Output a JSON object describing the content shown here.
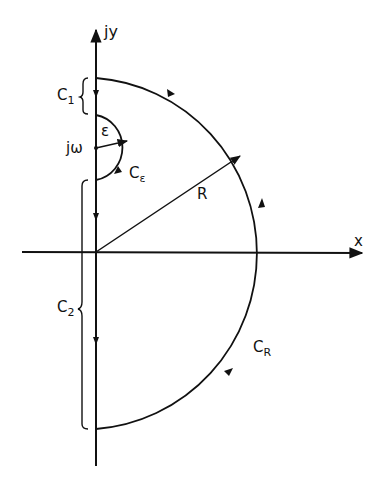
{
  "diagram": {
    "type": "contour-integration-path",
    "axes": {
      "vertical_label": "jy",
      "horizontal_label": "x"
    },
    "labels": {
      "c1": {
        "main": "C",
        "sub": "1"
      },
      "c2": {
        "main": "C",
        "sub": "2"
      },
      "c_epsilon": {
        "main": "C",
        "sub": "ε"
      },
      "c_r": {
        "main": "C",
        "sub": "R"
      },
      "epsilon": "ε",
      "j_omega": "jω",
      "radius": "R"
    },
    "colors": {
      "stroke": "#111111",
      "background": "#ffffff"
    }
  }
}
